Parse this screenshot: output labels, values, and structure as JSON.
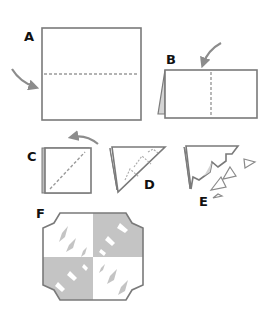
{
  "diagram": {
    "colors": {
      "outline": "#7a7a7a",
      "fold_line": "#9a9a9a",
      "arrow": "#8c8c8c",
      "shade": "#c4c4c4",
      "shade_light": "#d9d9d9",
      "paper": "#ffffff",
      "label": "#111111"
    },
    "steps": [
      {
        "id": "A",
        "label": "A",
        "description": "Square with horizontal dashed fold line; arrow pointing to left edge"
      },
      {
        "id": "B",
        "label": "B",
        "description": "Folded rectangle with vertical dashed fold line; arrow pointing down to top edge"
      },
      {
        "id": "C",
        "label": "C",
        "description": "Folded square with diagonal dashed fold line; curved arrow above"
      },
      {
        "id": "D",
        "label": "D",
        "description": "Triangle with dashed triangular cut lines"
      },
      {
        "id": "E",
        "label": "E",
        "description": "Cut triangle with zigzag edge and cut-out small triangles"
      },
      {
        "id": "F",
        "label": "F",
        "description": "Unfolded snowflake with four quadrants and diamond cut-outs"
      }
    ]
  }
}
